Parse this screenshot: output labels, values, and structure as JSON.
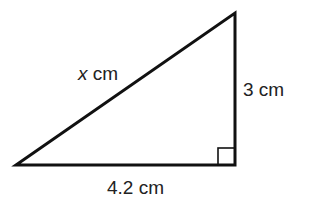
{
  "diagram": {
    "type": "right-triangle",
    "colors": {
      "stroke": "#111111",
      "text": "#222222",
      "background": "#ffffff"
    },
    "vertices": {
      "left": [
        16,
        165
      ],
      "right_angle": [
        235,
        165
      ],
      "top": [
        235,
        13
      ]
    },
    "right_angle_marker_size": 17,
    "labels": {
      "hypotenuse": {
        "variable": "x",
        "unit": " cm"
      },
      "vertical_leg": "3 cm",
      "base_leg": "4.2 cm"
    }
  }
}
